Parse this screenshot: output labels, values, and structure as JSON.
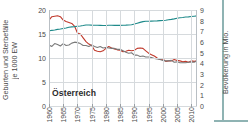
{
  "figure": {
    "country_label": "Österreich",
    "frame_color": "#8fb3b3",
    "grid_color": "#d6dadd",
    "axis_color": "#b9bfc4"
  },
  "axes": {
    "left_title_line1": "Geburten und Sterbefälle",
    "left_title_line2": "je 1000 EW",
    "right_title": "Bevölkerung in Mio.",
    "left_ticks": [
      "20",
      "15",
      "10",
      "5",
      "0"
    ],
    "right_ticks": [
      "9",
      "8",
      "7",
      "6",
      "5",
      "4",
      "3",
      "2",
      "1",
      "0"
    ],
    "x_ticks": [
      "1960",
      "1965",
      "1970",
      "1975",
      "1980",
      "1985",
      "1990",
      "1995",
      "2000",
      "2005",
      "2010"
    ]
  },
  "chart_data": {
    "type": "line",
    "title": "Österreich",
    "xlabel": "",
    "ylabel": "Geburten und Sterbefälle je 1000 EW",
    "y2label": "Bevölkerung in Mio.",
    "xlim": [
      1960,
      2012
    ],
    "ylim": [
      0,
      20
    ],
    "y2lim": [
      0,
      9
    ],
    "grid": true,
    "legend_position": "none",
    "x": [
      1960,
      1961,
      1962,
      1963,
      1964,
      1965,
      1966,
      1967,
      1968,
      1969,
      1970,
      1971,
      1972,
      1973,
      1974,
      1975,
      1976,
      1977,
      1978,
      1979,
      1980,
      1981,
      1982,
      1983,
      1984,
      1985,
      1986,
      1987,
      1988,
      1989,
      1990,
      1991,
      1992,
      1993,
      1994,
      1995,
      1996,
      1997,
      1998,
      1999,
      2000,
      2001,
      2002,
      2003,
      2004,
      2005,
      2006,
      2007,
      2008,
      2009,
      2010,
      2011,
      2012
    ],
    "series": [
      {
        "name": "Geburten je 1000 EW",
        "color": "#c0392b",
        "axis": "left",
        "values": [
          17.9,
          18.6,
          18.7,
          18.8,
          18.6,
          17.9,
          17.6,
          17.4,
          17.2,
          16.6,
          15.2,
          15.0,
          14.2,
          13.4,
          12.9,
          12.6,
          11.6,
          11.4,
          11.3,
          11.5,
          12.0,
          12.4,
          12.1,
          11.9,
          11.7,
          11.6,
          11.3,
          11.4,
          11.6,
          11.5,
          11.6,
          12.0,
          12.1,
          12.0,
          11.5,
          11.0,
          10.7,
          10.4,
          10.0,
          9.7,
          9.8,
          9.3,
          9.4,
          9.4,
          9.7,
          9.5,
          9.4,
          9.2,
          9.3,
          9.1,
          9.4,
          9.3,
          9.4
        ]
      },
      {
        "name": "Sterbefälle je 1000 EW",
        "color": "#7a7a7a",
        "axis": "left",
        "values": [
          12.7,
          12.4,
          13.0,
          12.8,
          12.5,
          13.0,
          12.6,
          12.7,
          13.1,
          13.3,
          13.2,
          13.0,
          12.6,
          12.6,
          12.4,
          12.7,
          12.4,
          12.2,
          12.4,
          12.1,
          12.2,
          12.1,
          12.0,
          12.0,
          11.8,
          11.8,
          11.5,
          11.2,
          11.0,
          11.1,
          10.6,
          10.6,
          10.3,
          10.4,
          10.2,
          10.2,
          10.1,
          9.9,
          9.8,
          9.7,
          9.5,
          9.4,
          9.4,
          9.5,
          9.1,
          9.2,
          9.0,
          9.0,
          9.0,
          9.1,
          9.2,
          9.1,
          9.4
        ]
      },
      {
        "name": "Bevölkerung in Mio.",
        "color": "#1f8a8a",
        "axis": "right",
        "values": [
          7.05,
          7.09,
          7.13,
          7.18,
          7.22,
          7.27,
          7.32,
          7.38,
          7.42,
          7.44,
          7.47,
          7.5,
          7.54,
          7.59,
          7.6,
          7.58,
          7.57,
          7.57,
          7.56,
          7.55,
          7.55,
          7.57,
          7.57,
          7.56,
          7.56,
          7.56,
          7.57,
          7.58,
          7.6,
          7.62,
          7.68,
          7.76,
          7.84,
          7.91,
          7.94,
          7.95,
          7.96,
          7.97,
          7.98,
          8.0,
          8.01,
          8.04,
          8.08,
          8.12,
          8.17,
          8.23,
          8.27,
          8.3,
          8.34,
          8.36,
          8.39,
          8.42,
          8.45
        ]
      }
    ]
  }
}
